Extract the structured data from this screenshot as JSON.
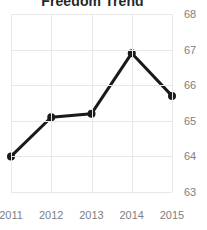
{
  "chart_data": {
    "type": "line",
    "title": "Freedom Trend",
    "xlabel": "",
    "ylabel": "",
    "categories": [
      "2011",
      "2012",
      "2013",
      "2014",
      "2015"
    ],
    "x": [
      2011,
      2012,
      2013,
      2014,
      2015
    ],
    "values": [
      64.0,
      65.1,
      65.2,
      66.9,
      65.7
    ],
    "series": [
      {
        "name": "Freedom Trend",
        "values": [
          64.0,
          65.1,
          65.2,
          66.9,
          65.7
        ]
      }
    ],
    "ylim": [
      63,
      68
    ],
    "xlim": [
      2011,
      2015
    ],
    "yticks": [
      68,
      67,
      66,
      65,
      64,
      63
    ],
    "ytick_labels": [
      "68",
      "67",
      "66",
      "65",
      "64",
      "63"
    ],
    "xticks": [
      2011,
      2012,
      2013,
      2014,
      2015
    ],
    "xtick_labels": [
      "2011",
      "2012",
      "2013",
      "2014",
      "2015"
    ],
    "grid": true,
    "grid_axis": "both",
    "legend": false,
    "legend_position": "none",
    "y_axis_side": "right",
    "colors": {
      "line": "#1a1a1a",
      "marker": "#1a1a1a",
      "grid": "#e8e8e8",
      "tick_label": "#808080",
      "title": "#262626",
      "background": "#ffffff"
    },
    "line_width": 3,
    "marker": "circle",
    "marker_size": 4
  }
}
